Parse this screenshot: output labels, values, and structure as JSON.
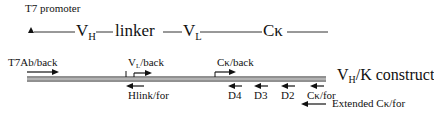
{
  "diagram": {
    "promoter_label": "T7 promoter",
    "gene_map": {
      "segments": [
        {
          "main": "V",
          "sub": "H"
        },
        {
          "main": "linker",
          "sub": ""
        },
        {
          "main": "V",
          "sub": "L"
        },
        {
          "main": "Cκ",
          "sub": ""
        }
      ]
    },
    "construct_label": {
      "main": "V",
      "sub": "H",
      "rest": "/K construct"
    },
    "primers": {
      "t7ab_back": "T7Ab/back",
      "vl_back": {
        "main": "V",
        "sub": "L",
        "rest": "/back"
      },
      "hlink_for": "Hlink/for",
      "ck_back": "Cκ/back",
      "d4": "D4",
      "d3": "D3",
      "d2": "D2",
      "ck_for": "Cκ/for",
      "extended_ck_for": "Extended Cκ/for"
    },
    "colors": {
      "line": "#222222",
      "double_line_fill": "#9a9a9a",
      "text": "#111111"
    }
  }
}
